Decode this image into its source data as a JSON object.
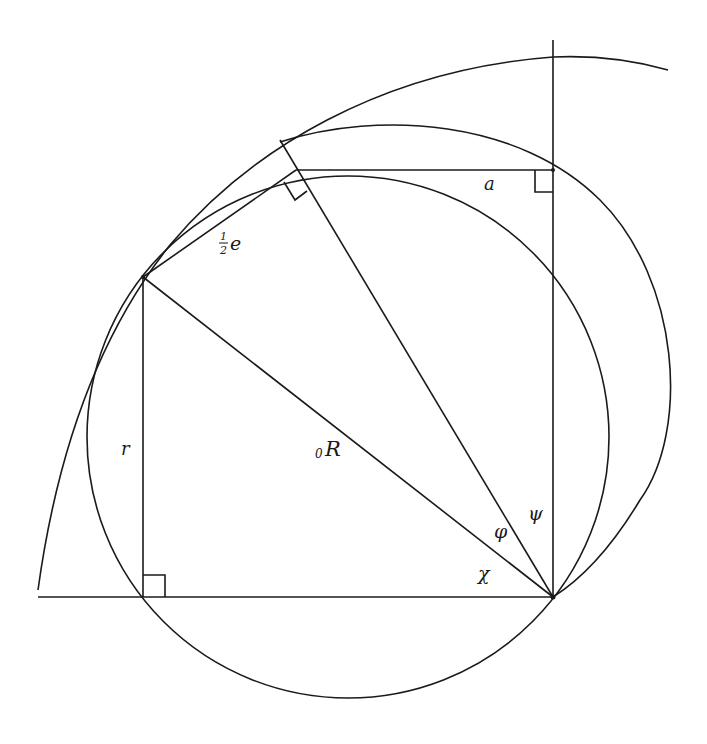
{
  "figure": {
    "labels": {
      "a": "a",
      "half_e_num": "1",
      "half_e_den": "2",
      "half_e_var": "e",
      "r": "r",
      "R_sub": "0",
      "R": "R",
      "phi": "φ",
      "psi": "ψ",
      "chi": "χ"
    },
    "colors": {
      "stroke": "#1a1a1a",
      "background": "#ffffff"
    }
  }
}
